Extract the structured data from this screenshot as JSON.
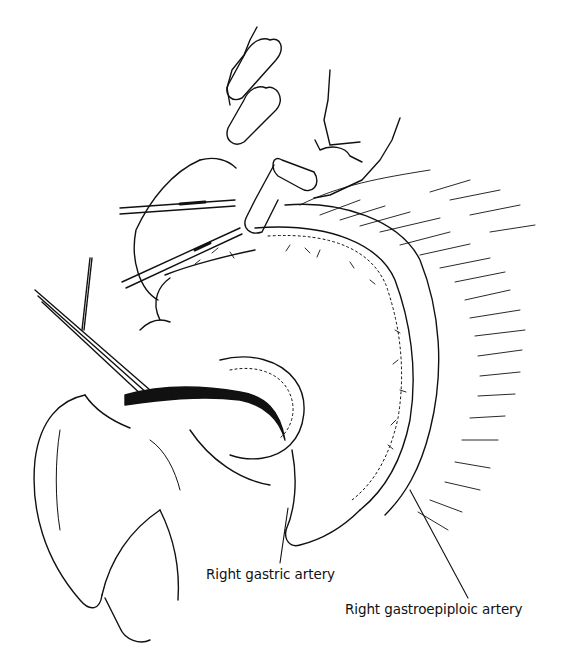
{
  "figure": {
    "style": {
      "ink_color": "#111111",
      "background": "#ffffff"
    },
    "labels": [
      {
        "id": "right-gastric-artery",
        "text": "Right gastric artery"
      },
      {
        "id": "right-gastroepiploic-artery",
        "text": "Right gastroepiploic artery"
      }
    ]
  }
}
